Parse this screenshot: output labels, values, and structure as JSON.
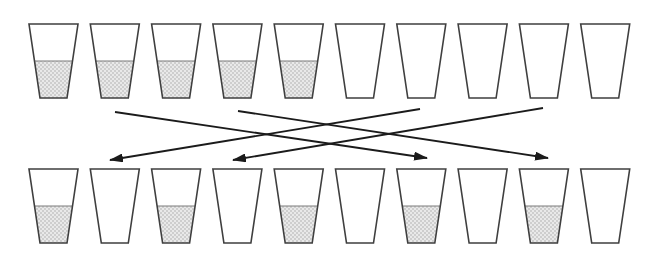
{
  "figure": {
    "name": "glasses-swap-puzzle-diagram",
    "background": "#ffffff",
    "outline_color": "#3f3f3f",
    "liquid_top_line_color": "#7a7a7a",
    "liquid_base_color": "#e9e9e9",
    "liquid_dot_color": "#9f9f9f",
    "arrow_color": "#1b1b1b",
    "layout": {
      "canvas_width": 653,
      "canvas_height": 262,
      "first_cup_center_x": 53.5,
      "cup_spacing_x": 61.3,
      "cup_top_width": 49,
      "cup_bottom_width": 27,
      "cup_height": 74,
      "top_row_y": 24,
      "bottom_row_y": 169,
      "fill_fraction": 0.5,
      "outline_stroke_width": 1.6,
      "arrow_stroke_width": 1.8,
      "arrowhead_length": 14,
      "arrowhead_width": 9
    },
    "rows": [
      {
        "name": "top-row",
        "glasses": [
          "full",
          "full",
          "full",
          "full",
          "full",
          "empty",
          "empty",
          "empty",
          "empty",
          "empty"
        ]
      },
      {
        "name": "bottom-row",
        "glasses": [
          "full",
          "empty",
          "full",
          "empty",
          "full",
          "empty",
          "full",
          "empty",
          "full",
          "empty"
        ]
      }
    ],
    "arrows": [
      {
        "label": "top-2-to-bottom-7",
        "from_glass": 2,
        "to_glass": 7,
        "x1": 115,
        "y1": 112,
        "x2": 427,
        "y2": 158
      },
      {
        "label": "top-4-to-bottom-9",
        "from_glass": 4,
        "to_glass": 9,
        "x1": 238,
        "y1": 111,
        "x2": 548,
        "y2": 158
      },
      {
        "label": "top-7-to-bottom-2",
        "from_glass": 7,
        "to_glass": 2,
        "x1": 420,
        "y1": 109,
        "x2": 110,
        "y2": 160
      },
      {
        "label": "top-9-to-bottom-4",
        "from_glass": 9,
        "to_glass": 4,
        "x1": 543,
        "y1": 108,
        "x2": 233,
        "y2": 160
      }
    ]
  }
}
